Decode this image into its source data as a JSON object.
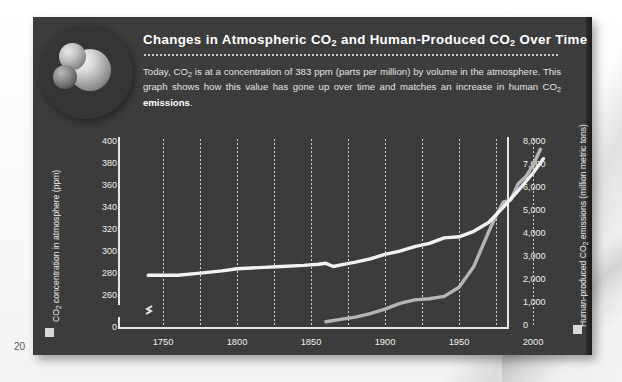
{
  "page": {
    "number": "20"
  },
  "badge": {
    "icon": "co2-molecule-icon"
  },
  "header": {
    "title_part1": "Changes in Atmospheric CO",
    "title_sub1": "2",
    "title_part2": " and Human-Produced CO",
    "title_sub2": "2",
    "title_part3": " Over Time",
    "title_plain": "Changes in Atmospheric CO2 and Human-Produced CO2 Over Time",
    "body_1": "Today, CO",
    "body_sub1": "2",
    "body_2": " is at a concentration of 383 ppm (parts per million) by volume in the atmosphere. This graph shows how this value has gone up over time and matches an increase in human CO",
    "body_sub2": "2",
    "body_3": " ",
    "body_bold": "emissions",
    "body_4": "."
  },
  "chart_data": {
    "type": "line",
    "title": "Changes in Atmospheric CO2 and Human-Produced CO2 Over Time",
    "xlabel": "",
    "xlim": [
      1735,
      2010
    ],
    "xticks": [
      1750,
      1800,
      1850,
      1900,
      1950,
      2000
    ],
    "xtick_labels": [
      "1750",
      "1800",
      "1850",
      "1900",
      "1950",
      "2000"
    ],
    "gridlines_x": [
      1750,
      1775,
      1800,
      1825,
      1850,
      1875,
      1900,
      1925,
      1950,
      1975,
      2000
    ],
    "grid": "vertical-dotted",
    "legend_position": "axis-swatch",
    "axes": [
      {
        "side": "left",
        "label_1": "CO",
        "label_sub": "2",
        "label_2": " concentration in atmosphere (ppm)",
        "label_plain": "CO2 concentration in atmosphere (ppm)",
        "ticks": [
          "400",
          "380",
          "360",
          "340",
          "320",
          "300",
          "280",
          "260",
          "0"
        ],
        "values": [
          400,
          380,
          360,
          340,
          320,
          300,
          280,
          260,
          0
        ],
        "axis_break": true,
        "break_between": [
          260,
          0
        ],
        "ylim": [
          255,
          405
        ]
      },
      {
        "side": "right",
        "label_1": "Human-produced CO",
        "label_sub": "2",
        "label_2": " emissions (million metric tons)",
        "label_plain": "Human-produced CO2 emissions (million metric tons)",
        "ticks": [
          "8,000",
          "7,000",
          "6,000",
          "5,000",
          "4,000",
          "3,000",
          "2,000",
          "1,000",
          "0"
        ],
        "values": [
          8000,
          7000,
          6000,
          5000,
          4000,
          3000,
          2000,
          1000,
          0
        ],
        "ylim": [
          0,
          8000
        ]
      }
    ],
    "series": [
      {
        "name": "CO2 concentration in atmosphere (ppm)",
        "axis": "left",
        "color": "#f2f2f2",
        "x": [
          1740,
          1750,
          1760,
          1775,
          1790,
          1800,
          1815,
          1830,
          1845,
          1855,
          1860,
          1865,
          1872,
          1880,
          1890,
          1900,
          1910,
          1920,
          1930,
          1940,
          1950,
          1960,
          1970,
          1980,
          1990,
          2000,
          2007
        ],
        "y": [
          277,
          277,
          277,
          279,
          281,
          283,
          284,
          285,
          286,
          287,
          288,
          285,
          287,
          289,
          292,
          296,
          299,
          303,
          306,
          311,
          312,
          317,
          325,
          339,
          354,
          370,
          383
        ]
      },
      {
        "name": "Human-produced CO2 emissions (million metric tons)",
        "axis": "right",
        "color": "#b5b5b5",
        "x": [
          1860,
          1870,
          1880,
          1890,
          1900,
          1910,
          1920,
          1930,
          1940,
          1950,
          1960,
          1970,
          1975,
          1980,
          1985,
          1990,
          1995,
          2000,
          2005
        ],
        "y": [
          100,
          200,
          300,
          450,
          650,
          900,
          1050,
          1100,
          1200,
          1600,
          2500,
          4000,
          4700,
          5300,
          5400,
          6100,
          6400,
          6900,
          7600
        ]
      }
    ]
  }
}
